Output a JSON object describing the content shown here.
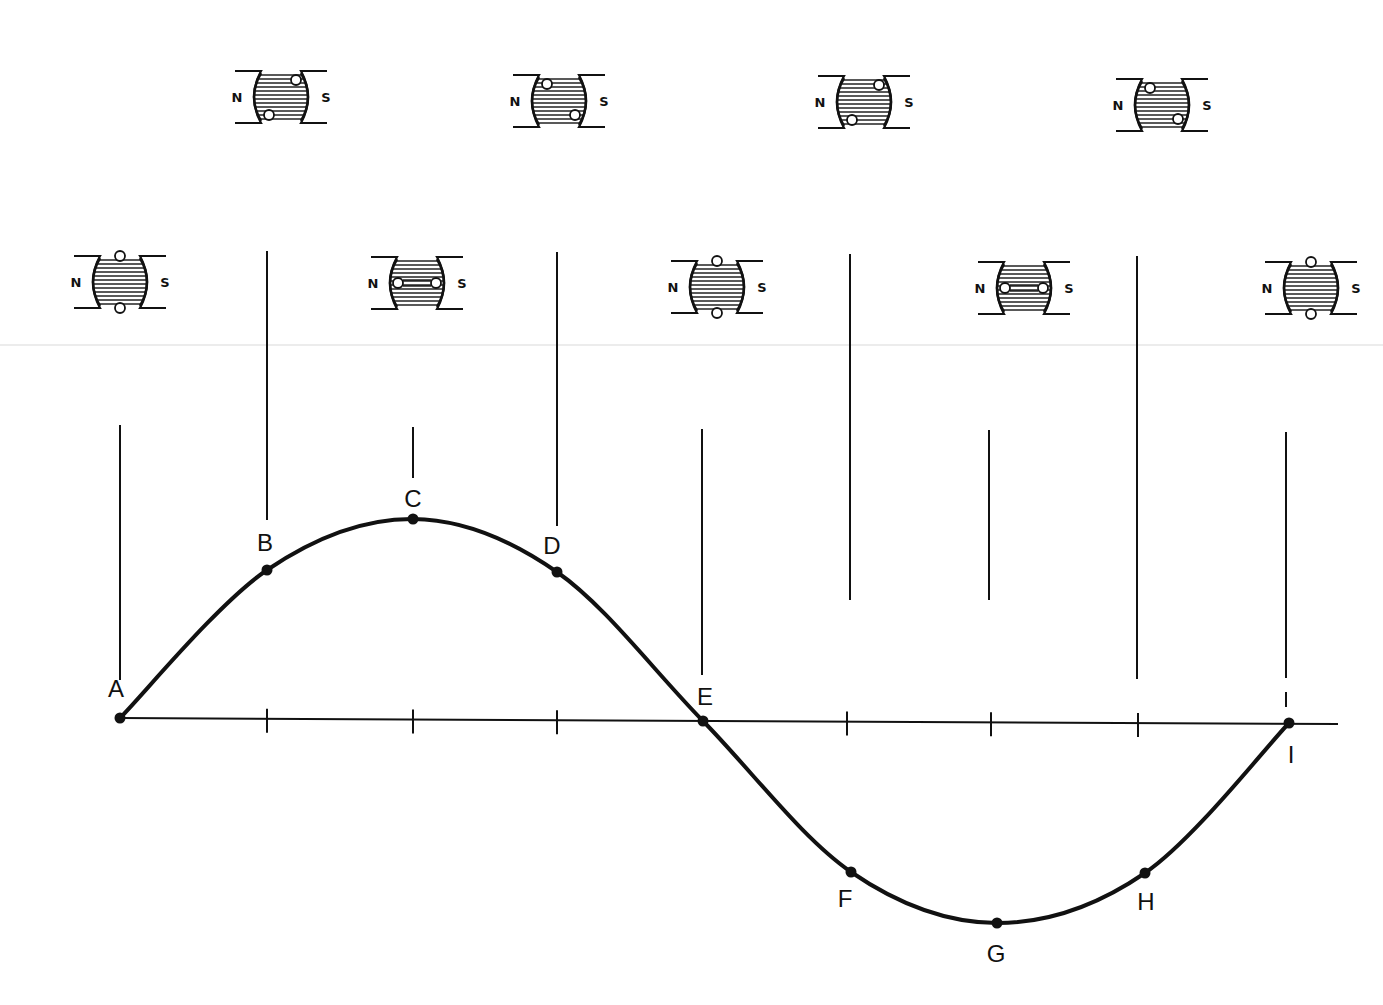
{
  "diagram": {
    "title": "",
    "colors": {
      "ink": "#111111",
      "background": "#ffffff",
      "hatch": "#222222",
      "loop_fill": "#ffffff"
    },
    "pole_labels": {
      "north": "N",
      "south": "S"
    },
    "axis": {
      "y": 721,
      "x_start": 120,
      "x_end": 1338
    },
    "ticks_x": [
      267,
      413,
      557,
      847,
      991,
      1138
    ],
    "points": [
      {
        "label": "A",
        "x": 120,
        "y": 718,
        "label_x": 116,
        "label_y": 697,
        "angle_deg": 0
      },
      {
        "label": "B",
        "x": 267,
        "y": 570,
        "label_x": 265,
        "label_y": 551,
        "angle_deg": 45
      },
      {
        "label": "C",
        "x": 413,
        "y": 519,
        "label_x": 413,
        "label_y": 507,
        "angle_deg": 90
      },
      {
        "label": "D",
        "x": 557,
        "y": 572,
        "label_x": 552,
        "label_y": 554,
        "angle_deg": 135
      },
      {
        "label": "E",
        "x": 703,
        "y": 721,
        "label_x": 705,
        "label_y": 705,
        "angle_deg": 180
      },
      {
        "label": "F",
        "x": 851,
        "y": 872,
        "label_x": 845,
        "label_y": 907,
        "angle_deg": 225
      },
      {
        "label": "G",
        "x": 997,
        "y": 923,
        "label_x": 996,
        "label_y": 962,
        "angle_deg": 270
      },
      {
        "label": "H",
        "x": 1145,
        "y": 873,
        "label_x": 1146,
        "label_y": 910,
        "angle_deg": 315
      },
      {
        "label": "I",
        "x": 1289,
        "y": 723,
        "label_x": 1291,
        "label_y": 763,
        "angle_deg": 360
      }
    ],
    "rotors": [
      {
        "point": "A",
        "cx": 120,
        "cy": 282,
        "loops": "vertical"
      },
      {
        "point": "B",
        "cx": 281,
        "cy": 97,
        "loops": "diag-ur-ll"
      },
      {
        "point": "C",
        "cx": 417,
        "cy": 283,
        "loops": "horizontal"
      },
      {
        "point": "D",
        "cx": 559,
        "cy": 101,
        "loops": "diag-ul-lr"
      },
      {
        "point": "E",
        "cx": 717,
        "cy": 287,
        "loops": "vertical"
      },
      {
        "point": "F",
        "cx": 864,
        "cy": 102,
        "loops": "diag-ur-ll"
      },
      {
        "point": "G",
        "cx": 1024,
        "cy": 288,
        "loops": "horizontal"
      },
      {
        "point": "H",
        "cx": 1162,
        "cy": 105,
        "loops": "diag-ul-lr"
      },
      {
        "point": "I",
        "cx": 1311,
        "cy": 288,
        "loops": "vertical"
      }
    ],
    "guide_lines": [
      {
        "x": 120,
        "y1": 425,
        "y2": 680,
        "dashed": false
      },
      {
        "x": 267,
        "y1": 251,
        "y2": 520,
        "dashed": false
      },
      {
        "x": 413,
        "y1": 427,
        "y2": 478,
        "dashed": false
      },
      {
        "x": 557,
        "y1": 252,
        "y2": 526,
        "dashed": false
      },
      {
        "x": 702,
        "y1": 429,
        "y2": 675,
        "dashed": false
      },
      {
        "x": 850,
        "y1": 254,
        "y2": 600,
        "dashed": false
      },
      {
        "x": 989,
        "y1": 430,
        "y2": 600,
        "dashed": false
      },
      {
        "x": 1137,
        "y1": 256,
        "y2": 679,
        "dashed": false
      },
      {
        "x": 1286,
        "y1": 432,
        "y2": 678,
        "dashed": false
      },
      {
        "x": 1286,
        "y1": 692,
        "y2": 707,
        "dashed": false
      }
    ]
  }
}
